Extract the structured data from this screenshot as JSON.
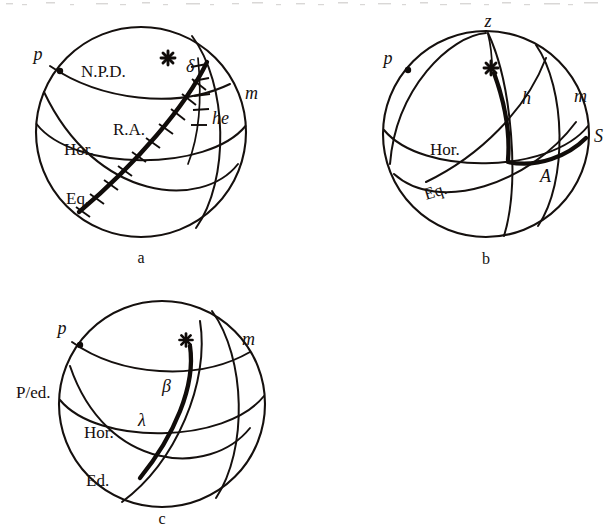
{
  "figure": {
    "kind": "celestial-sphere-coordinate-diagrams",
    "panel_count": 3,
    "ink_color": "#15100e",
    "background_color": "#ffffff"
  },
  "top_artifact": {
    "description": "cut-off bottom edge of a line of text from the page above",
    "visible": true
  },
  "panels": [
    {
      "id": "a",
      "caption": "a",
      "system": "equatorial",
      "labels": {
        "pole": "p",
        "great_circle_1": "N.P.D.",
        "declination": "δ",
        "hour_angle": "he",
        "meridian": "m",
        "right_ascension": "R.A.",
        "horizon": "Hor.",
        "equator": "Eq."
      },
      "star_marker": "asterisk",
      "tick_marked_arcs": [
        "R.A.",
        "he"
      ]
    },
    {
      "id": "b",
      "caption": "b",
      "system": "horizontal",
      "labels": {
        "zenith": "z",
        "pole": "p",
        "altitude": "h",
        "meridian": "m",
        "south_point": "S",
        "azimuth": "A",
        "horizon": "Hor.",
        "equator": "Eq."
      },
      "star_marker": "asterisk",
      "tick_marked_arcs": []
    },
    {
      "id": "c",
      "caption": "c",
      "system": "ecliptic",
      "labels": {
        "pole": "p",
        "ecliptic_pole": "P/ed.",
        "ecliptic_latitude": "β",
        "ecliptic_longitude": "λ",
        "meridian": "m",
        "horizon": "Hor.",
        "ecliptic": "Ed."
      },
      "star_marker": "asterisk",
      "tick_marked_arcs": []
    }
  ]
}
